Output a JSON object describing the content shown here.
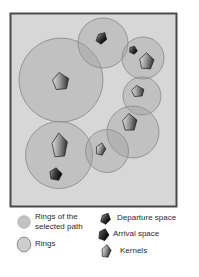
{
  "diagram": {
    "background": "#d7d7d7",
    "border_color": "#4a4a4a",
    "ring_fill": "#9e9e9e",
    "ring_fill_opacity": 0.38,
    "ring_stroke": "#8f8f8f",
    "rings": [
      {
        "name": "ring-top-left",
        "cx": 61,
        "cy": 80,
        "r": 42
      },
      {
        "name": "ring-top-middle",
        "cx": 103,
        "cy": 43,
        "r": 25
      },
      {
        "name": "ring-top-right",
        "cx": 143,
        "cy": 58,
        "r": 21
      },
      {
        "name": "ring-mid-right",
        "cx": 142,
        "cy": 96,
        "r": 19
      },
      {
        "name": "ring-right",
        "cx": 133,
        "cy": 132,
        "r": 26
      },
      {
        "name": "ring-bottom-left",
        "cx": 59,
        "cy": 155,
        "r": 33.5
      },
      {
        "name": "ring-bottom-middle",
        "cx": 107,
        "cy": 151,
        "r": 21.5
      }
    ],
    "pentagons": [
      {
        "name": "space-pentagon-1",
        "kind": "dark",
        "cx": 102,
        "cy": 38,
        "w": 10,
        "h": 12,
        "rot": 40
      },
      {
        "name": "kernel-pentagon-1",
        "kind": "kernel",
        "cx": 61,
        "cy": 81,
        "w": 17,
        "h": 17,
        "rot": 0
      },
      {
        "name": "space-pentagon-2",
        "kind": "dark",
        "cx": 133.5,
        "cy": 50,
        "w": 8.5,
        "h": 7.5,
        "rot": 30
      },
      {
        "name": "kernel-pentagon-2",
        "kind": "kernel",
        "cx": 147,
        "cy": 61,
        "w": 15,
        "h": 16,
        "rot": 10
      },
      {
        "name": "kernel-pentagon-3",
        "kind": "kernel",
        "cx": 138,
        "cy": 91,
        "w": 13,
        "h": 11,
        "rot": 0
      },
      {
        "name": "kernel-pentagon-4",
        "kind": "kernel",
        "cx": 130,
        "cy": 122,
        "w": 15,
        "h": 17,
        "rot": 5
      },
      {
        "name": "kernel-pentagon-5",
        "kind": "kernel",
        "cx": 60,
        "cy": 145,
        "w": 16,
        "h": 24,
        "rot": 3
      },
      {
        "name": "space-pentagon-3",
        "kind": "dark",
        "cx": 56,
        "cy": 174,
        "w": 13,
        "h": 12,
        "rot": 15
      },
      {
        "name": "kernel-pentagon-6",
        "kind": "kernel",
        "cx": 101,
        "cy": 149,
        "w": 10,
        "h": 12,
        "rot": 20
      }
    ]
  },
  "legend": {
    "left_items": [
      {
        "icon": "selected-ring-icon",
        "label": "Rings of the selected path"
      },
      {
        "icon": "ring-icon",
        "label": "Rings"
      }
    ],
    "right_items": [
      {
        "icon": "departure-pentagon-icon",
        "label": "Departure space"
      },
      {
        "icon": "arrival-pentagon-icon",
        "label": "Arrival space"
      },
      {
        "icon": "kernel-pentagon-icon",
        "label": "Kernels"
      }
    ]
  }
}
